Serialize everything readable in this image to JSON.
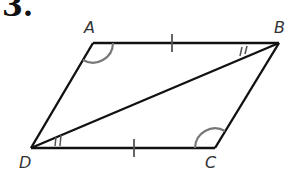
{
  "problem": {
    "number": "3."
  },
  "figure": {
    "shape": "parallelogram",
    "vertices": {
      "A": {
        "label": "A",
        "x": 93,
        "y": 43
      },
      "B": {
        "label": "B",
        "x": 279,
        "y": 43
      },
      "C": {
        "label": "C",
        "x": 215,
        "y": 148
      },
      "D": {
        "label": "D",
        "x": 31,
        "y": 148
      }
    },
    "diagonal": "DB",
    "markings": {
      "congruent_sides": [
        "AB",
        "DC"
      ],
      "congruent_angles_single_arc": [
        "A",
        "C"
      ],
      "congruent_angles_double_tick": [
        "ABD",
        "CDB"
      ]
    },
    "colors": {
      "line": "#111111",
      "arc": "#777777",
      "label": "#333333"
    }
  }
}
